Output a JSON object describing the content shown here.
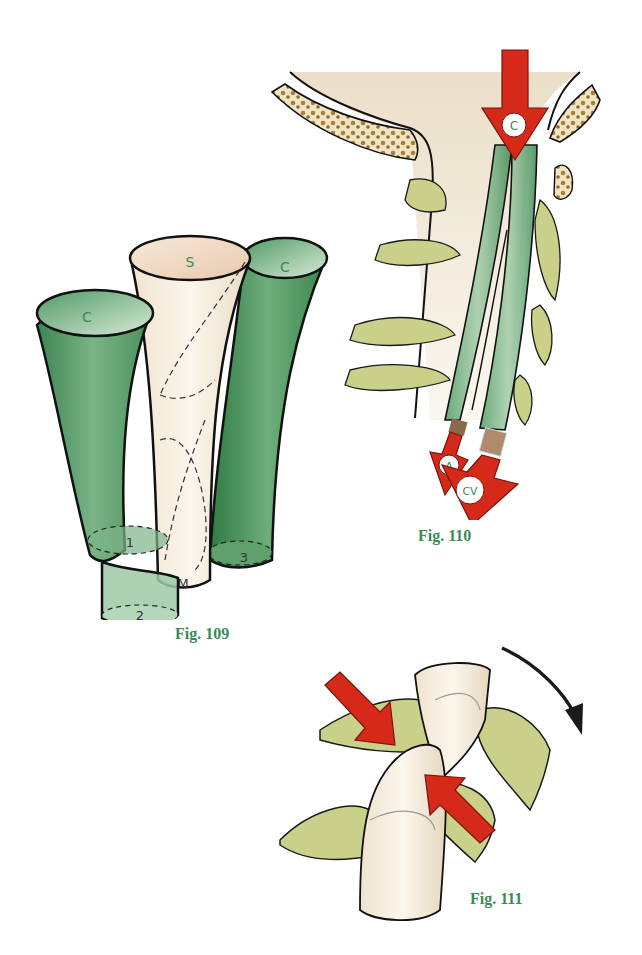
{
  "colors": {
    "green_tube": "#4f9a63",
    "cream": "#f3eadb",
    "vertebra": "#c9d08a",
    "red_arrow": "#d52a1a",
    "caption": "#3a8a5a",
    "outline": "#1a1a1a",
    "bone": "#a8803a"
  },
  "figures": [
    {
      "id": "fig109",
      "caption": "Fig. 109",
      "labels": {
        "left_tube_top": "C",
        "center_tube_top": "S",
        "right_tube_top": "C",
        "base_1": "1",
        "base_2": "2",
        "base_3": "3",
        "base_m": "M"
      }
    },
    {
      "id": "fig110",
      "caption": "Fig. 110",
      "labels": {
        "top_arrow": "C",
        "bottom_left_arrow": "A",
        "bottom_right_arrow": "CV"
      }
    },
    {
      "id": "fig111",
      "caption": "Fig. 111"
    }
  ]
}
